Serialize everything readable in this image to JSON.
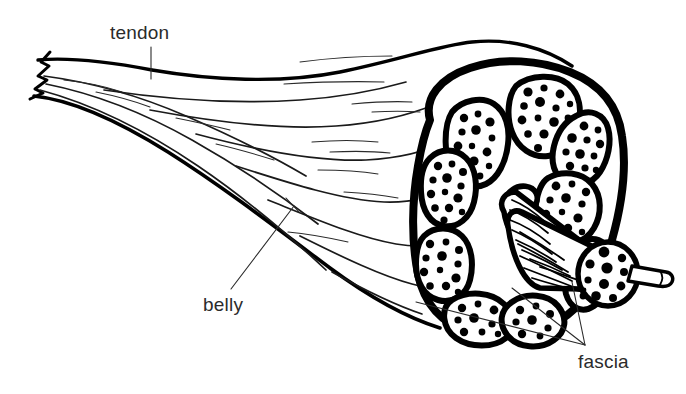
{
  "figure": {
    "kind": "anatomical-line-drawing",
    "background_color": "#ffffff",
    "ink_color": "#000000",
    "label_color": "#2b2b2b"
  },
  "labels": {
    "tendon": "tendon",
    "belly": "belly",
    "fascia": "fascia"
  },
  "leaders": {
    "tendon": {
      "style": "vertical-tick",
      "from_x": 151,
      "from_y": 46,
      "to_x": 151,
      "to_y": 78
    },
    "belly": {
      "style": "diagonal-tick",
      "from_x": 232,
      "from_y": 288,
      "to_x": 295,
      "to_y": 205
    },
    "fascia": {
      "style": "three-branch-converging",
      "apex_x": 585,
      "apex_y": 345,
      "branch_count": 3
    }
  },
  "parts": {
    "tendon_desc": "fibrous cord with torn zigzag free end, fanning into the belly",
    "belly_desc": "fusiform muscle body with longitudinal striation lines",
    "fascia_desc": "thick connective sheath enclosing the whole muscle and each fascicle",
    "fascicle_desc": "bundle of muscle fibers shown as dotted blobs in cross-section",
    "protruding_fascicle_desc": "one fascicle pulled out, cylinder with dotted cut face and a single fiber"
  },
  "counts": {
    "fascicles_in_section": 9,
    "protruding_fascicle_end_dots": 11
  }
}
